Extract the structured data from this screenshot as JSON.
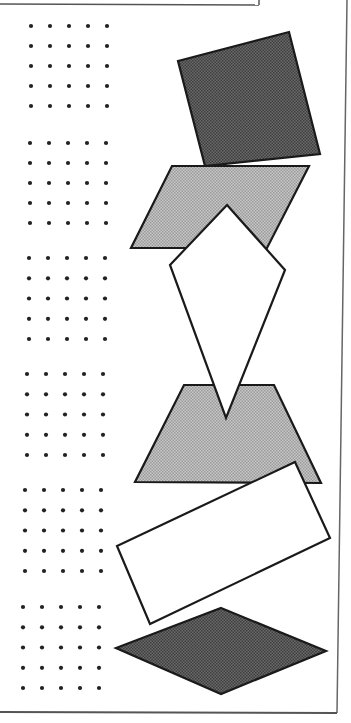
{
  "worksheet": {
    "colors": {
      "paper": "#ffffff",
      "ink": "#1a1a1a",
      "dot": "#222222",
      "dark_fill": "#5a5a5a",
      "light_fill": "#b4b4b4",
      "white_fill": "#ffffff",
      "border": "#555555"
    },
    "dot_grids": [
      {
        "name": "dot-grid-1",
        "x0": 31,
        "y0": 26,
        "cols": 5,
        "rows": 5,
        "dx": 19,
        "dy": 20
      },
      {
        "name": "dot-grid-2",
        "x0": 30,
        "y0": 143,
        "cols": 5,
        "rows": 5,
        "dx": 19,
        "dy": 20
      },
      {
        "name": "dot-grid-3",
        "x0": 29,
        "y0": 258,
        "cols": 5,
        "rows": 5,
        "dx": 19,
        "dy": 20.25
      },
      {
        "name": "dot-grid-4",
        "x0": 27,
        "y0": 374,
        "cols": 5,
        "rows": 5,
        "dx": 19,
        "dy": 20.25
      },
      {
        "name": "dot-grid-5",
        "x0": 25,
        "y0": 490,
        "cols": 5,
        "rows": 5,
        "dx": 19,
        "dy": 20.25
      },
      {
        "name": "dot-grid-6",
        "x0": 23,
        "y0": 607,
        "cols": 5,
        "rows": 5,
        "dx": 19,
        "dy": 20.25
      }
    ],
    "shapes": [
      {
        "name": "square-shape",
        "kind": "square",
        "fill": "dark_fill",
        "points": "178,61 289,32 320,154 205,166"
      },
      {
        "name": "parallelogram-shape",
        "kind": "parallelogram",
        "fill": "light_fill",
        "points": "172,166 309,166 267,248 131,248"
      },
      {
        "name": "trapezoid-shape",
        "kind": "trapezoid",
        "fill": "light_fill",
        "points": "184,385 274,385 321,483 135,482"
      },
      {
        "name": "kite-shape",
        "kind": "kite",
        "fill": "white_fill",
        "points": "227,205 285,270 226,418 170,265"
      },
      {
        "name": "rectangle-shape",
        "kind": "rectangle",
        "fill": "white_fill",
        "points": "295,462 330,538 150,624 117,546"
      },
      {
        "name": "rhombus-shape",
        "kind": "rhombus",
        "fill": "dark_fill",
        "points": "221,608 326,651 221,694 116,648"
      }
    ]
  }
}
